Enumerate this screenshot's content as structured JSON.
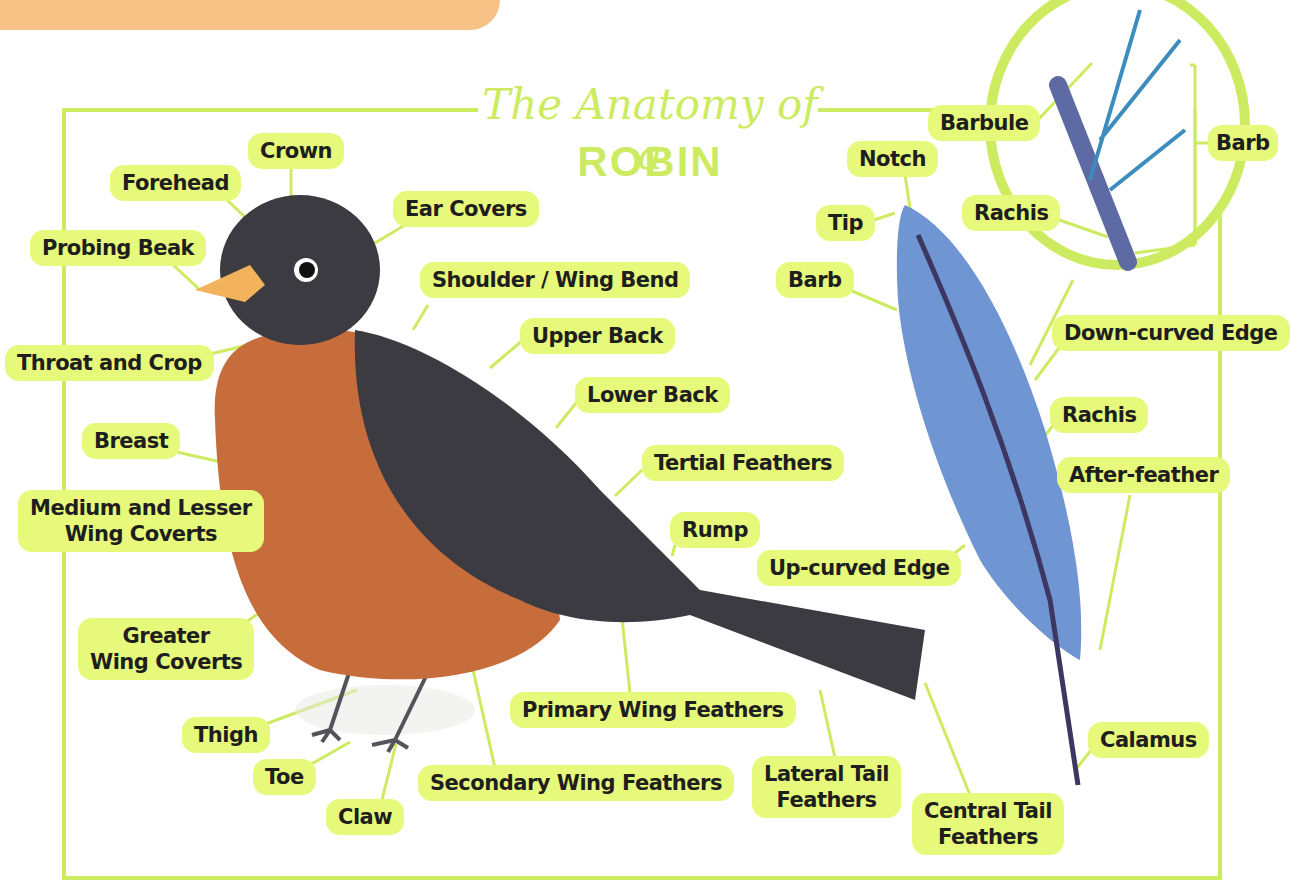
{
  "title": {
    "line1": "The Anatomy of a",
    "line2": "ROBIN"
  },
  "colors": {
    "frame": "#cdeb61",
    "label_bg": "#e6f97a",
    "label_text": "#1e1e1e",
    "robin_dark": "#3c3b42",
    "robin_breast": "#c76d3b",
    "beak": "#f2b35c",
    "feather_blue": "#6f95d2",
    "top_band": "#f7c285"
  },
  "robin_labels": [
    {
      "id": "crown",
      "text": "Crown"
    },
    {
      "id": "forehead",
      "text": "Forehead"
    },
    {
      "id": "ear-covers",
      "text": "Ear Covers"
    },
    {
      "id": "probing-beak",
      "text": "Probing Beak"
    },
    {
      "id": "shoulder-wing-bend",
      "text": "Shoulder / Wing Bend"
    },
    {
      "id": "upper-back",
      "text": "Upper Back"
    },
    {
      "id": "throat-and-crop",
      "text": "Throat and Crop"
    },
    {
      "id": "lower-back",
      "text": "Lower Back"
    },
    {
      "id": "breast",
      "text": "Breast"
    },
    {
      "id": "tertial-feathers",
      "text": "Tertial Feathers"
    },
    {
      "id": "medium-lesser-wing-coverts",
      "text": "Medium and Lesser\nWing Coverts"
    },
    {
      "id": "rump",
      "text": "Rump"
    },
    {
      "id": "greater-wing-coverts",
      "text": "Greater\nWing Coverts"
    },
    {
      "id": "primary-wing-feathers",
      "text": "Primary Wing Feathers"
    },
    {
      "id": "thigh",
      "text": "Thigh"
    },
    {
      "id": "toe",
      "text": "Toe"
    },
    {
      "id": "claw",
      "text": "Claw"
    },
    {
      "id": "secondary-wing-feathers",
      "text": "Secondary Wing Feathers"
    },
    {
      "id": "lateral-tail-feathers",
      "text": "Lateral Tail\nFeathers"
    },
    {
      "id": "central-tail-feathers",
      "text": "Central Tail\nFeathers"
    }
  ],
  "feather_labels": [
    {
      "id": "notch",
      "text": "Notch"
    },
    {
      "id": "tip",
      "text": "Tip"
    },
    {
      "id": "barb",
      "text": "Barb"
    },
    {
      "id": "down-curved-edge",
      "text": "Down-curved Edge"
    },
    {
      "id": "rachis",
      "text": "Rachis"
    },
    {
      "id": "after-feather",
      "text": "After-feather"
    },
    {
      "id": "up-curved-edge",
      "text": "Up-curved Edge"
    },
    {
      "id": "calamus",
      "text": "Calamus"
    }
  ],
  "inset_labels": [
    {
      "id": "barbule",
      "text": "Barbule"
    },
    {
      "id": "barb",
      "text": "Barb"
    },
    {
      "id": "rachis",
      "text": "Rachis"
    }
  ]
}
